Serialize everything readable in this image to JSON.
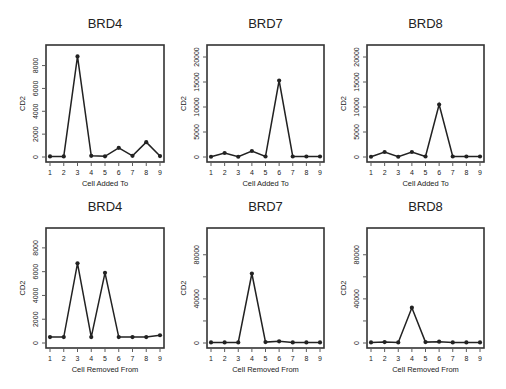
{
  "chart_data": [
    {
      "type": "line",
      "title": "BRD4",
      "xlabel": "Cell Added To",
      "ylabel": "CD2",
      "x": [
        1,
        2,
        3,
        4,
        5,
        6,
        7,
        8,
        9
      ],
      "values": [
        50,
        50,
        8800,
        100,
        60,
        800,
        100,
        1300,
        80
      ],
      "xticks": [
        "1",
        "2",
        "3",
        "4",
        "5",
        "6",
        "7",
        "8",
        "9"
      ],
      "yticks": [
        0,
        2000,
        4000,
        6000,
        8000
      ],
      "ytick_labels": [
        "0",
        "2000",
        "4000",
        "6000",
        "8000"
      ],
      "ylim": [
        -200,
        9100
      ],
      "grid": false,
      "position": "top-left"
    },
    {
      "type": "line",
      "title": "BRD7",
      "xlabel": "Cell Added To",
      "ylabel": "CD2",
      "x": [
        1,
        2,
        3,
        4,
        5,
        6,
        7,
        8,
        9
      ],
      "values": [
        50,
        800,
        50,
        1200,
        100,
        15300,
        100,
        100,
        100
      ],
      "xticks": [
        "1",
        "2",
        "3",
        "4",
        "5",
        "6",
        "7",
        "8",
        "9"
      ],
      "yticks": [
        0,
        5000,
        10000,
        15000,
        20000
      ],
      "ytick_labels": [
        "0",
        "5000",
        "10000",
        "15000",
        "20000"
      ],
      "ylim": [
        -500,
        20800
      ],
      "grid": false,
      "position": "top-center"
    },
    {
      "type": "line",
      "title": "BRD8",
      "xlabel": "Cell Added To",
      "ylabel": "CD2",
      "x": [
        1,
        2,
        3,
        4,
        5,
        6,
        7,
        8,
        9
      ],
      "values": [
        50,
        1000,
        50,
        1000,
        100,
        10500,
        100,
        100,
        100
      ],
      "xticks": [
        "1",
        "2",
        "3",
        "4",
        "5",
        "6",
        "7",
        "8",
        "9"
      ],
      "yticks": [
        0,
        5000,
        10000,
        15000,
        20000
      ],
      "ytick_labels": [
        "0",
        "5000",
        "10000",
        "15000",
        "20000"
      ],
      "ylim": [
        -500,
        20800
      ],
      "grid": false,
      "position": "top-right"
    },
    {
      "type": "line",
      "title": "BRD4",
      "xlabel": "Cell Removed From",
      "ylabel": "CD2",
      "x": [
        1,
        2,
        3,
        4,
        5,
        6,
        7,
        8,
        9
      ],
      "values": [
        500,
        500,
        6700,
        500,
        5900,
        500,
        500,
        500,
        650
      ],
      "xticks": [
        "1",
        "2",
        "3",
        "4",
        "5",
        "6",
        "7",
        "8",
        "9"
      ],
      "yticks": [
        0,
        2000,
        4000,
        6000,
        8000
      ],
      "ytick_labels": [
        "0",
        "2000",
        "4000",
        "6000",
        "8000"
      ],
      "ylim": [
        -200,
        9000
      ],
      "grid": false,
      "position": "bottom-left"
    },
    {
      "type": "line",
      "title": "BRD7",
      "xlabel": "Cell Removed From",
      "ylabel": "CD2",
      "x": [
        1,
        2,
        3,
        4,
        5,
        6,
        7,
        8,
        9
      ],
      "values": [
        500,
        500,
        500,
        63000,
        800,
        1500,
        500,
        500,
        500
      ],
      "xticks": [
        "1",
        "2",
        "3",
        "4",
        "5",
        "6",
        "7",
        "8",
        "9"
      ],
      "yticks": [
        0,
        20000,
        40000,
        60000,
        80000
      ],
      "ytick_labels": [
        "0",
        "",
        "40000",
        "",
        "80000"
      ],
      "ylim": [
        -2000,
        97000
      ],
      "grid": false,
      "position": "bottom-center"
    },
    {
      "type": "line",
      "title": "BRD8",
      "xlabel": "Cell Removed From",
      "ylabel": "CD2",
      "x": [
        1,
        2,
        3,
        4,
        5,
        6,
        7,
        8,
        9
      ],
      "values": [
        500,
        800,
        500,
        32000,
        800,
        1200,
        500,
        500,
        500
      ],
      "xticks": [
        "1",
        "2",
        "3",
        "4",
        "5",
        "6",
        "7",
        "8",
        "9"
      ],
      "yticks": [
        0,
        20000,
        40000,
        60000,
        80000
      ],
      "ytick_labels": [
        "0",
        "",
        "40000",
        "",
        "80000"
      ],
      "ylim": [
        -2000,
        97000
      ],
      "grid": false,
      "position": "bottom-right"
    }
  ]
}
